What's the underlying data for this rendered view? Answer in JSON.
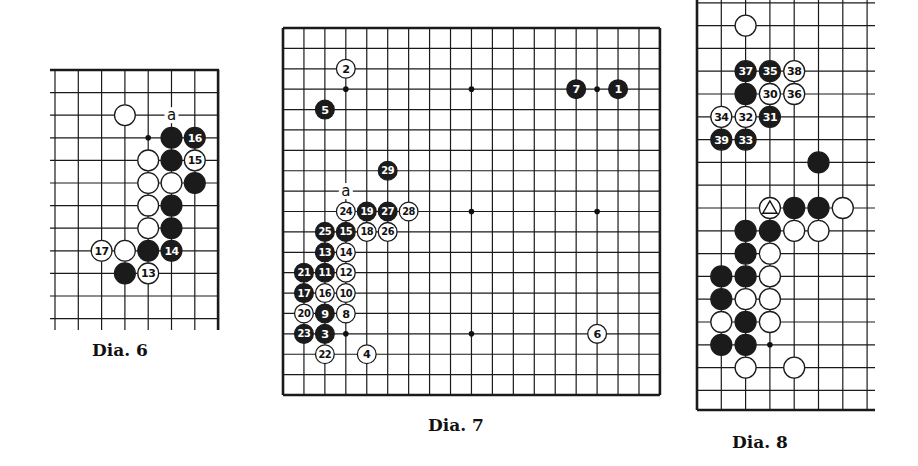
{
  "diagrams": [
    {
      "id": "dia6",
      "caption": "Dia. 6",
      "grid": {
        "x0": 55,
        "y0": 70,
        "dx": 23.3,
        "dy": 22.6,
        "cols": 8,
        "rows": 12,
        "right_edge": true,
        "top_edge": true
      },
      "hoshi": [
        [
          4,
          3
        ]
      ],
      "label_a": {
        "c": 5,
        "r": 2,
        "text": "a"
      },
      "stones": [
        {
          "c": 3,
          "r": 2,
          "color": "white",
          "label": ""
        },
        {
          "c": 5,
          "r": 3,
          "color": "black",
          "label": ""
        },
        {
          "c": 6,
          "r": 3,
          "color": "black",
          "label": "16"
        },
        {
          "c": 4,
          "r": 4,
          "color": "white",
          "label": ""
        },
        {
          "c": 5,
          "r": 4,
          "color": "black",
          "label": ""
        },
        {
          "c": 6,
          "r": 4,
          "color": "white",
          "label": "15"
        },
        {
          "c": 4,
          "r": 5,
          "color": "white",
          "label": ""
        },
        {
          "c": 5,
          "r": 5,
          "color": "white",
          "label": ""
        },
        {
          "c": 6,
          "r": 5,
          "color": "black",
          "label": ""
        },
        {
          "c": 4,
          "r": 6,
          "color": "white",
          "label": ""
        },
        {
          "c": 5,
          "r": 6,
          "color": "black",
          "label": ""
        },
        {
          "c": 4,
          "r": 7,
          "color": "white",
          "label": ""
        },
        {
          "c": 5,
          "r": 7,
          "color": "black",
          "label": ""
        },
        {
          "c": 2,
          "r": 8,
          "color": "white",
          "label": "17"
        },
        {
          "c": 3,
          "r": 8,
          "color": "white",
          "label": ""
        },
        {
          "c": 4,
          "r": 8,
          "color": "black",
          "label": ""
        },
        {
          "c": 5,
          "r": 8,
          "color": "black",
          "label": "14"
        },
        {
          "c": 3,
          "r": 9,
          "color": "black",
          "label": ""
        },
        {
          "c": 4,
          "r": 9,
          "color": "white",
          "label": "13"
        }
      ]
    },
    {
      "id": "dia7",
      "caption": "Dia. 7",
      "grid": {
        "x0": 283,
        "y0": 28,
        "dx": 20.94,
        "dy": 20.39,
        "cols": 19,
        "rows": 19
      },
      "hoshi": [
        [
          3,
          3
        ],
        [
          9,
          3
        ],
        [
          15,
          3
        ],
        [
          3,
          9
        ],
        [
          9,
          9
        ],
        [
          15,
          9
        ],
        [
          3,
          15
        ],
        [
          9,
          15
        ],
        [
          15,
          15
        ]
      ],
      "label_a": {
        "c": 3,
        "r": 8,
        "text": "a"
      },
      "stones": [
        {
          "c": 3,
          "r": 2,
          "color": "white",
          "label": "2"
        },
        {
          "c": 2,
          "r": 4,
          "color": "black",
          "label": "5"
        },
        {
          "c": 14,
          "r": 3,
          "color": "black",
          "label": "7"
        },
        {
          "c": 16,
          "r": 3,
          "color": "black",
          "label": "1"
        },
        {
          "c": 5,
          "r": 7,
          "color": "black",
          "label": "29"
        },
        {
          "c": 3,
          "r": 9,
          "color": "white",
          "label": "24"
        },
        {
          "c": 4,
          "r": 9,
          "color": "black",
          "label": "19"
        },
        {
          "c": 5,
          "r": 9,
          "color": "black",
          "label": "27"
        },
        {
          "c": 6,
          "r": 9,
          "color": "white",
          "label": "28"
        },
        {
          "c": 2,
          "r": 10,
          "color": "black",
          "label": "25"
        },
        {
          "c": 3,
          "r": 10,
          "color": "black",
          "label": "15"
        },
        {
          "c": 4,
          "r": 10,
          "color": "white",
          "label": "18"
        },
        {
          "c": 5,
          "r": 10,
          "color": "white",
          "label": "26"
        },
        {
          "c": 2,
          "r": 11,
          "color": "black",
          "label": "13"
        },
        {
          "c": 3,
          "r": 11,
          "color": "white",
          "label": "14"
        },
        {
          "c": 1,
          "r": 12,
          "color": "black",
          "label": "21"
        },
        {
          "c": 2,
          "r": 12,
          "color": "black",
          "label": "11"
        },
        {
          "c": 3,
          "r": 12,
          "color": "white",
          "label": "12"
        },
        {
          "c": 1,
          "r": 13,
          "color": "black",
          "label": "17"
        },
        {
          "c": 2,
          "r": 13,
          "color": "white",
          "label": "16"
        },
        {
          "c": 3,
          "r": 13,
          "color": "white",
          "label": "10"
        },
        {
          "c": 1,
          "r": 14,
          "color": "white",
          "label": "20"
        },
        {
          "c": 2,
          "r": 14,
          "color": "black",
          "label": "9"
        },
        {
          "c": 3,
          "r": 14,
          "color": "white",
          "label": "8"
        },
        {
          "c": 1,
          "r": 15,
          "color": "black",
          "label": "23"
        },
        {
          "c": 2,
          "r": 15,
          "color": "black",
          "label": "3"
        },
        {
          "c": 2,
          "r": 16,
          "color": "white",
          "label": "22"
        },
        {
          "c": 4,
          "r": 16,
          "color": "white",
          "label": "4"
        },
        {
          "c": 15,
          "r": 15,
          "color": "white",
          "label": "6"
        }
      ]
    },
    {
      "id": "dia8",
      "caption": "Dia. 8",
      "grid": {
        "x0": 697,
        "y0": -20,
        "dx": 24.3,
        "dy": 22.8,
        "cols": 8,
        "rows": 19,
        "left_edge": true,
        "bottom_edge": true
      },
      "hoshi": [
        [
          3,
          16
        ]
      ],
      "stones": [
        {
          "c": 2,
          "r": 2,
          "color": "white",
          "label": ""
        },
        {
          "c": 2,
          "r": 4,
          "color": "black",
          "label": "37"
        },
        {
          "c": 3,
          "r": 4,
          "color": "black",
          "label": "35"
        },
        {
          "c": 4,
          "r": 4,
          "color": "white",
          "label": "38"
        },
        {
          "c": 2,
          "r": 5,
          "color": "black",
          "label": ""
        },
        {
          "c": 3,
          "r": 5,
          "color": "white",
          "label": "30"
        },
        {
          "c": 4,
          "r": 5,
          "color": "white",
          "label": "36"
        },
        {
          "c": 1,
          "r": 6,
          "color": "white",
          "label": "34"
        },
        {
          "c": 2,
          "r": 6,
          "color": "white",
          "label": "32"
        },
        {
          "c": 3,
          "r": 6,
          "color": "black",
          "label": "31"
        },
        {
          "c": 1,
          "r": 7,
          "color": "black",
          "label": "39"
        },
        {
          "c": 2,
          "r": 7,
          "color": "black",
          "label": "33"
        },
        {
          "c": 5,
          "r": 8,
          "color": "black",
          "label": ""
        },
        {
          "c": 3,
          "r": 10,
          "color": "white",
          "label": "triangle"
        },
        {
          "c": 4,
          "r": 10,
          "color": "black",
          "label": ""
        },
        {
          "c": 5,
          "r": 10,
          "color": "black",
          "label": ""
        },
        {
          "c": 6,
          "r": 10,
          "color": "white",
          "label": ""
        },
        {
          "c": 2,
          "r": 11,
          "color": "black",
          "label": ""
        },
        {
          "c": 3,
          "r": 11,
          "color": "black",
          "label": ""
        },
        {
          "c": 4,
          "r": 11,
          "color": "white",
          "label": ""
        },
        {
          "c": 5,
          "r": 11,
          "color": "white",
          "label": ""
        },
        {
          "c": 2,
          "r": 12,
          "color": "black",
          "label": ""
        },
        {
          "c": 3,
          "r": 12,
          "color": "white",
          "label": ""
        },
        {
          "c": 1,
          "r": 13,
          "color": "black",
          "label": ""
        },
        {
          "c": 2,
          "r": 13,
          "color": "black",
          "label": ""
        },
        {
          "c": 3,
          "r": 13,
          "color": "white",
          "label": ""
        },
        {
          "c": 1,
          "r": 14,
          "color": "black",
          "label": ""
        },
        {
          "c": 2,
          "r": 14,
          "color": "white",
          "label": ""
        },
        {
          "c": 3,
          "r": 14,
          "color": "white",
          "label": ""
        },
        {
          "c": 1,
          "r": 15,
          "color": "white",
          "label": ""
        },
        {
          "c": 2,
          "r": 15,
          "color": "black",
          "label": ""
        },
        {
          "c": 3,
          "r": 15,
          "color": "white",
          "label": ""
        },
        {
          "c": 1,
          "r": 16,
          "color": "black",
          "label": ""
        },
        {
          "c": 2,
          "r": 16,
          "color": "black",
          "label": ""
        },
        {
          "c": 2,
          "r": 17,
          "color": "white",
          "label": ""
        },
        {
          "c": 4,
          "r": 17,
          "color": "white",
          "label": ""
        }
      ]
    }
  ]
}
